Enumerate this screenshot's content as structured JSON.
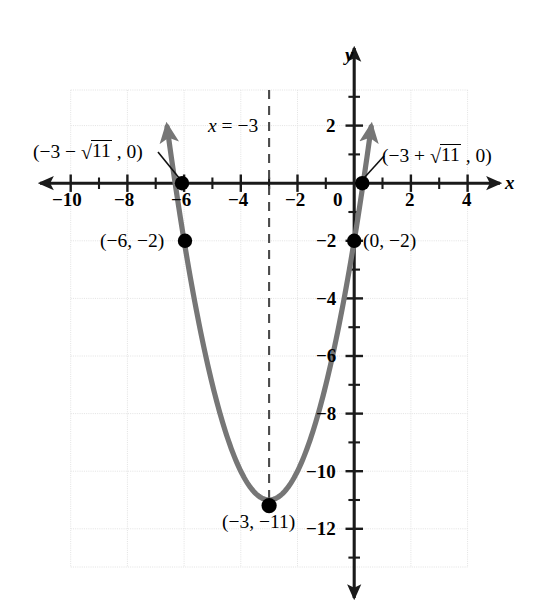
{
  "chart_data": {
    "type": "line",
    "title": "",
    "subtitle": "",
    "xlabel": "x",
    "ylabel": "y",
    "xlim": [
      -11.5,
      5.2
    ],
    "ylim": [
      -13.2,
      3.4
    ],
    "grid": true,
    "grid_step": 2,
    "legend": "none",
    "function": "y = x^2 + 6x - 2",
    "curve_color": "#767676",
    "point_color": "#000000",
    "axis_color": "#1a1a1a",
    "grid_color": "#e2e2e2",
    "x_ticks": [
      -10,
      -8,
      -6,
      -4,
      -2,
      0,
      2,
      4
    ],
    "x_tick_labels": [
      "−10",
      "−8",
      "−6",
      "−4",
      "−2",
      "0",
      "2",
      "4"
    ],
    "x_minor_ticks": [
      -11,
      -9,
      -7,
      -5,
      -3,
      -1,
      1,
      3
    ],
    "y_ticks": [
      2,
      -2,
      -4,
      -6,
      -8,
      -10,
      -12
    ],
    "y_tick_labels": [
      "2",
      "−2",
      "−4",
      "−6",
      "−8",
      "−10",
      "−12"
    ],
    "y_minor_ticks": [
      3,
      1,
      -1,
      -3,
      -5,
      -7,
      -9,
      -11,
      -13
    ],
    "series": [
      {
        "name": "parabola",
        "type": "quadratic",
        "a": 1,
        "b": 6,
        "c": -2,
        "x_start": -6.6,
        "x_end": 0.6,
        "arrow_start": true,
        "arrow_end": true
      }
    ],
    "annotations": [
      {
        "name": "axis-of-symmetry",
        "kind": "vline",
        "x": -3,
        "y_top": 3.2,
        "y_bottom": -11,
        "style": "dashed",
        "label": "x = −3"
      }
    ],
    "points": [
      {
        "name": "left-x-intercept",
        "x": -6.3166,
        "y": 0,
        "label": "(−3 − √11 , 0)",
        "label_parts": {
          "pre": "(−3 − ",
          "radicand": "11",
          "post": " , 0)"
        },
        "leader": true
      },
      {
        "name": "right-x-intercept",
        "x": 0.3166,
        "y": 0,
        "label": "(−3 + √11 , 0)",
        "label_parts": {
          "pre": "(−3 + ",
          "radicand": "11",
          "post": " , 0)"
        },
        "leader": true
      },
      {
        "name": "point-left",
        "x": -6,
        "y": -2,
        "label": "(−6, −2)",
        "leader": false
      },
      {
        "name": "y-intercept",
        "x": 0,
        "y": -2,
        "label": "(0, −2)",
        "leader": false
      },
      {
        "name": "vertex",
        "x": -3,
        "y": -11,
        "label": "(−3, −11)",
        "leader": false
      }
    ]
  },
  "labels": {
    "x_axis_name": "x",
    "y_axis_name": "y",
    "symmetry_prefix": "x",
    "symmetry_eq": " = −3",
    "left_intercept_pre": "(−3 − ",
    "left_intercept_radicand": "11",
    "left_intercept_post": " , 0)",
    "right_intercept_pre": "(−3 + ",
    "right_intercept_radicand": "11",
    "right_intercept_post": " , 0)",
    "radical_sign": "√",
    "point_left": "(−6, −2)",
    "y_intercept": "(0, −2)",
    "vertex": "(−3, −11)",
    "tick_x_m10": "−10",
    "tick_x_m8": "−8",
    "tick_x_m6": "−6",
    "tick_x_m4": "−4",
    "tick_x_m2": "−2",
    "tick_x_0": "0",
    "tick_x_2": "2",
    "tick_x_4": "4",
    "tick_y_2": "2",
    "tick_y_m2": "−2",
    "tick_y_m4": "−4",
    "tick_y_m6": "−6",
    "tick_y_m8": "−8",
    "tick_y_m10": "−10",
    "tick_y_m12": "−12"
  }
}
